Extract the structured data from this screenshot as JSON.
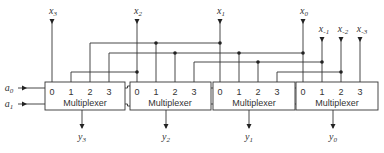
{
  "select_inputs": [
    {
      "name": "a",
      "sub": "0"
    },
    {
      "name": "a",
      "sub": "1"
    }
  ],
  "multiplexers": [
    {
      "label": "Multiplexer",
      "pins": [
        "0",
        "1",
        "2",
        "3"
      ],
      "output": {
        "name": "y",
        "sub": "3"
      }
    },
    {
      "label": "Multiplexer",
      "pins": [
        "0",
        "1",
        "2",
        "3"
      ],
      "output": {
        "name": "y",
        "sub": "2"
      }
    },
    {
      "label": "Multiplexer",
      "pins": [
        "0",
        "1",
        "2",
        "3"
      ],
      "output": {
        "name": "y",
        "sub": "1"
      }
    },
    {
      "label": "Multiplexer",
      "pins": [
        "0",
        "1",
        "2",
        "3"
      ],
      "output": {
        "name": "y",
        "sub": "0"
      }
    }
  ],
  "data_inputs": [
    {
      "name": "x",
      "sub": "3"
    },
    {
      "name": "x",
      "sub": "2"
    },
    {
      "name": "x",
      "sub": "1"
    },
    {
      "name": "x",
      "sub": "0"
    },
    {
      "name": "x",
      "sub": "-1"
    },
    {
      "name": "x",
      "sub": "-2"
    },
    {
      "name": "x",
      "sub": "-3"
    }
  ],
  "colors": {
    "ink": "#333333",
    "background": "#ffffff"
  }
}
